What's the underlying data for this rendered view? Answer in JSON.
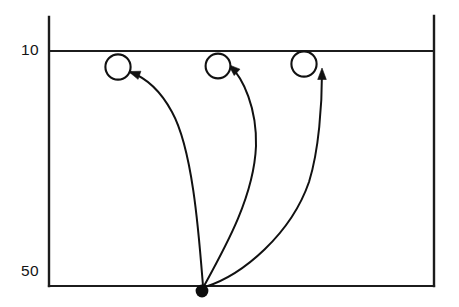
{
  "figure": {
    "kind": "schematic-diagram",
    "background_color": "#ffffff",
    "stroke_color": "#111111",
    "width": 459,
    "height": 307
  },
  "axis": {
    "depth_labels": [
      {
        "name": "upper-depth",
        "text": "10"
      },
      {
        "name": "lower-depth",
        "text": "50"
      }
    ],
    "left_axis_x": 49,
    "right_axis_x": 434,
    "top_y": 17,
    "upper_line_y": 51,
    "bottom_line_y": 286
  },
  "source": {
    "label": "source-point",
    "x": 202,
    "y": 291,
    "radius": 6.4,
    "filled": true
  },
  "targets": [
    {
      "label": "target-circle-left",
      "x": 118,
      "y": 67,
      "radius": 12.6,
      "filled": false
    },
    {
      "label": "target-circle-middle",
      "x": 218,
      "y": 66,
      "radius": 12.4,
      "filled": false
    },
    {
      "label": "target-circle-right",
      "x": 304,
      "y": 64,
      "radius": 12.6,
      "filled": false
    }
  ],
  "trajectories": [
    {
      "label": "trajectory-left",
      "path": "M 203 286 C 199 236 193 150 172 112 C 158 86 141 76 130 72",
      "arrow": {
        "x": 130.5,
        "y": 72.2,
        "angle_deg": 199
      }
    },
    {
      "label": "trajectory-middle",
      "path": "M 204 286 C 226 246 254 196 256 146 C 257 108 243 78 230.5 66.5",
      "arrow": {
        "x": 230.0,
        "y": 66.0,
        "angle_deg": 222
      }
    },
    {
      "label": "trajectory-right",
      "path": "M 205 287 C 243 275 291 234 309 182 C 319 150 322 104 322 72",
      "arrow": {
        "x": 322,
        "y": 70,
        "angle_deg": 270
      }
    }
  ]
}
